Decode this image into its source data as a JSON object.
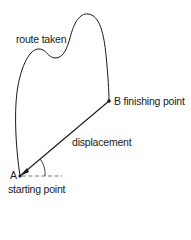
{
  "diagram": {
    "labels": {
      "route": "route taken",
      "displacement": "displacement",
      "point_b": "B finishing point",
      "point_a_letter": "A",
      "point_a_desc": "starting point"
    },
    "points": {
      "A": {
        "x": 20,
        "y": 176,
        "name": "starting point"
      },
      "B": {
        "x": 109,
        "y": 101,
        "name": "finishing point"
      }
    },
    "colors": {
      "stroke": "#1a1a1a",
      "reference_line": "#555555",
      "background": "#ffffff"
    }
  }
}
